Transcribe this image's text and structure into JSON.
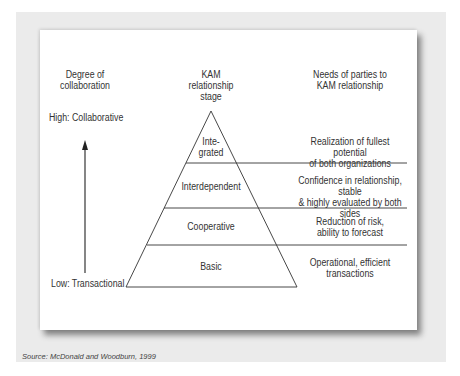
{
  "headers": {
    "collaboration": "Degree of\ncollaboration",
    "stage": "KAM\nrelationship\nstage",
    "needs": "Needs of parties to\nKAM relationship"
  },
  "axis": {
    "high": "High: Collaborative",
    "low": "Low: Transactional"
  },
  "levels": [
    {
      "stage": "Inte-\ngrated",
      "need": "Realization of fullest potential\nof both organizations"
    },
    {
      "stage": "Interdependent",
      "need": "Confidence in relationship, stable\n& highly  evaluated  by both sides"
    },
    {
      "stage": "Cooperative",
      "need": "Reduction of risk,\nability to forecast"
    },
    {
      "stage": "Basic",
      "need": "Operational, efficient\ntransactions"
    }
  ],
  "source": "Source: McDonald and Woodburn, 1999",
  "colors": {
    "line": "#333333",
    "frame": "#ebebeb",
    "panel": "#ffffff"
  }
}
